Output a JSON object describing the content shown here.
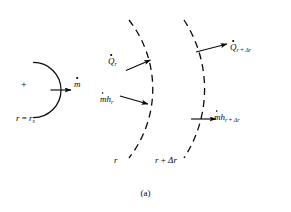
{
  "figure": {
    "caption": "(a)",
    "source_circle": {
      "center_marker": "+",
      "radius_label_var": "r",
      "radius_label_eq": " = ",
      "radius_label_val": "r",
      "radius_label_sub": "s",
      "mass_flow_symbol": "m",
      "mass_flow_sub": "",
      "mass_flow_full": "mdot"
    },
    "inner_surface": {
      "radius_label": "r",
      "heat_symbol": "Q",
      "heat_sub": "r",
      "enthalpy_symbol": "mh",
      "enthalpy_sub": "r"
    },
    "outer_surface": {
      "radius_label_base": "r",
      "radius_label_plus": " + ",
      "radius_label_delta": "Δr",
      "heat_symbol": "Q",
      "heat_sub_base": "r",
      "heat_sub_plus": " + ",
      "heat_sub_delta": "Δr",
      "enthalpy_symbol": "mh",
      "enthalpy_sub_base": "r",
      "enthalpy_sub_plus": " + ",
      "enthalpy_sub_delta": "Δr"
    },
    "colors": {
      "ink": "#0a0a0a",
      "background": "#ffffff"
    }
  }
}
